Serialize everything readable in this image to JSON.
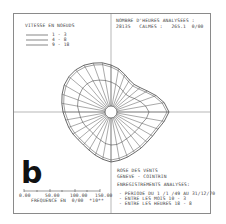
{
  "figure_label": "b",
  "legend": {
    "title": "VITESSE EN NOEUDS",
    "entries": [
      "1 - 3",
      "4 - 8",
      "9 - 18"
    ]
  },
  "header": {
    "line1": "NOMBRE D'HEURES ANALYSEES :",
    "line2": "28135   CALMES :   265.1  0/00"
  },
  "footer": {
    "title1": "ROSE DES VENTS",
    "title2": "GENEVE - COINTRIN",
    "subtitle": "ENREGISTREMENTS ANALYSES:",
    "items": [
      "- PERIODE DU 1 /1 /49 AU 31/12/70",
      "- ENTRE LES MOIS 10 - 3",
      "- ENTRE LES HEURES 18 - 8"
    ]
  },
  "scale": {
    "ticks": [
      "0.00",
      "50.00",
      "100.00",
      "150.00"
    ],
    "label": "FREQUENCE EN  0/00  *10**"
  },
  "chart_data": {
    "type": "wind-rose",
    "legend_title": "VITESSE EN NOEUDS",
    "series": [
      {
        "name": "1 - 3"
      },
      {
        "name": "4 - 8"
      },
      {
        "name": "9 - 18"
      }
    ],
    "directions_deg": [
      0,
      10,
      20,
      30,
      40,
      50,
      60,
      70,
      80,
      90,
      100,
      110,
      120,
      130,
      140,
      150,
      160,
      170,
      180,
      190,
      200,
      210,
      220,
      230,
      240,
      250,
      260,
      270,
      280,
      290,
      300,
      310,
      320,
      330,
      340,
      350
    ],
    "outer_radius_px": [
      47,
      44,
      40,
      37,
      36,
      38,
      42,
      48,
      54,
      58,
      54,
      50,
      48,
      47,
      47,
      47,
      48,
      49,
      50,
      48,
      46,
      44,
      43,
      43,
      44,
      45,
      46,
      48,
      50,
      52,
      54,
      55,
      55,
      54,
      52,
      50
    ],
    "inner_radius_px": [
      30,
      28,
      26,
      24,
      23,
      24,
      27,
      31,
      35,
      38,
      36,
      33,
      32,
      31,
      31,
      31,
      32,
      33,
      33,
      32,
      30,
      29,
      28,
      28,
      29,
      30,
      31,
      32,
      34,
      35,
      36,
      37,
      37,
      36,
      34,
      32
    ],
    "calm_circle_radius_px": 6,
    "scale_axis": {
      "ticks": [
        0,
        50,
        100,
        150
      ],
      "label": "FREQUENCE EN 0/00 *10**"
    },
    "calms_per_mille": 265.1,
    "hours_analysed": 28135
  }
}
